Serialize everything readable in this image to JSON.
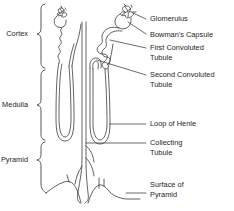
{
  "figure": {
    "kind": "anatomical-diagram",
    "background_color": "#ffffff",
    "ink_color": "#2b2b2b",
    "text_color": "#1d1d1d"
  },
  "region_labels": [
    {
      "id": "cortex",
      "text": "Cortex",
      "x": 28,
      "y": 34
    },
    {
      "id": "medulla",
      "text": "Medulla",
      "x": 28,
      "y": 105
    },
    {
      "id": "pyramid",
      "text": "Pyramid",
      "x": 28,
      "y": 160
    }
  ],
  "part_labels": [
    {
      "id": "glomerulus",
      "lines": [
        "Glomerulus"
      ],
      "x": 150,
      "y": 19
    },
    {
      "id": "bowmans-capsule",
      "lines": [
        "Bowman's Capsule"
      ],
      "x": 150,
      "y": 35
    },
    {
      "id": "first-convoluted-tubule",
      "lines": [
        "First Convoluted",
        "Tubule"
      ],
      "x": 150,
      "y": 51
    },
    {
      "id": "second-convoluted-tubule",
      "lines": [
        "Second Convoluted",
        "Tubule"
      ],
      "x": 150,
      "y": 78
    },
    {
      "id": "loop-of-henle",
      "lines": [
        "Loop of Henle"
      ],
      "x": 150,
      "y": 124
    },
    {
      "id": "collecting-tubule",
      "lines": [
        "Collecting",
        "Tubule"
      ],
      "x": 150,
      "y": 146
    },
    {
      "id": "surface-of-pyramid",
      "lines": [
        "Surface of",
        "Pyramid"
      ],
      "x": 150,
      "y": 188
    }
  ]
}
